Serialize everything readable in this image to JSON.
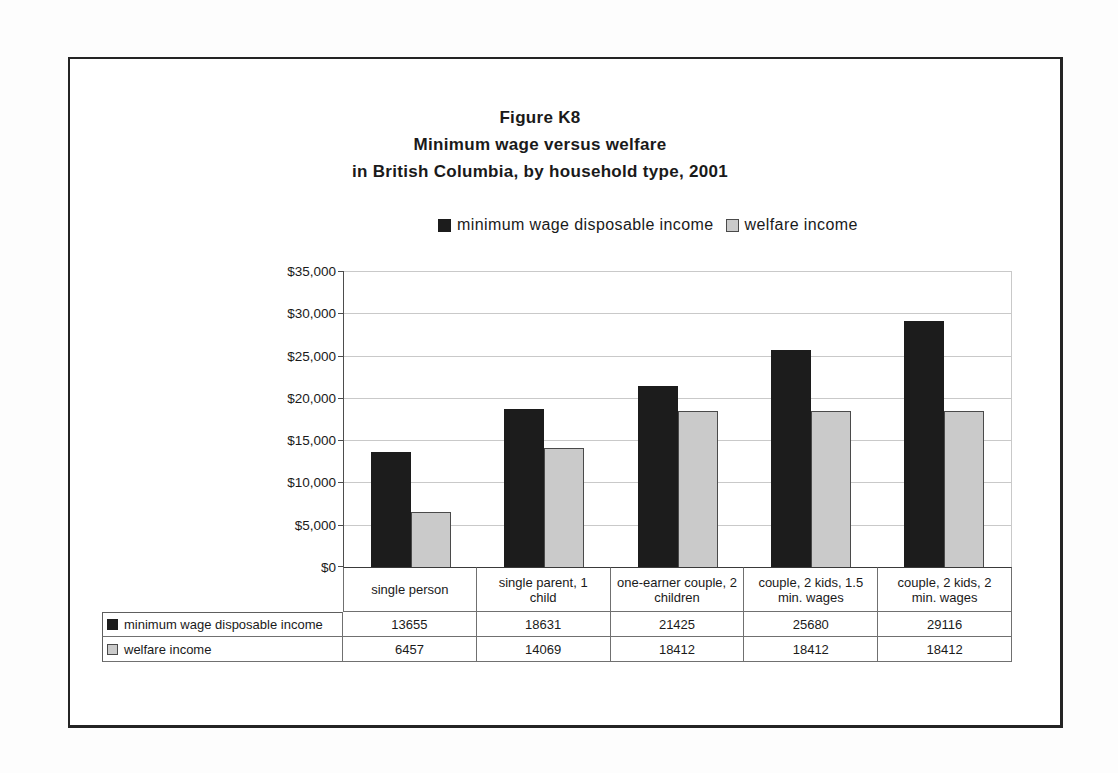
{
  "chart_data": {
    "type": "bar",
    "title": "Figure K8 Minimum wage versus welfare in British Columbia, by household type, 2001",
    "title_lines": [
      "Figure K8",
      "Minimum wage versus welfare",
      "in British Columbia, by household type, 2001"
    ],
    "categories": [
      "single person",
      "single parent, 1 child",
      "one-earner couple, 2 children",
      "couple, 2 kids, 1.5 min. wages",
      "couple, 2 kids, 2 min. wages"
    ],
    "category_lines": [
      [
        "single person"
      ],
      [
        "single parent, 1",
        "child"
      ],
      [
        "one-earner couple, 2",
        "children"
      ],
      [
        "couple, 2 kids, 1.5",
        "min. wages"
      ],
      [
        "couple, 2 kids, 2",
        "min. wages"
      ]
    ],
    "series": [
      {
        "name": "minimum wage disposable income",
        "color": "#1c1c1c",
        "values": [
          13655,
          18631,
          21425,
          25680,
          29116
        ]
      },
      {
        "name": "welfare income",
        "color": "#cacaca",
        "border": "#4a4a4a",
        "values": [
          6457,
          14069,
          18412,
          18412,
          18412
        ]
      }
    ],
    "xlabel": "",
    "ylabel": "",
    "ylim": [
      0,
      35000
    ],
    "y_tick_interval": 5000,
    "y_ticks": [
      {
        "value": 35000,
        "label": "$35,000"
      },
      {
        "value": 30000,
        "label": "$30,000"
      },
      {
        "value": 25000,
        "label": "$25,000"
      },
      {
        "value": 20000,
        "label": "$20,000"
      },
      {
        "value": 15000,
        "label": "$15,000"
      },
      {
        "value": 10000,
        "label": "$10,000"
      },
      {
        "value": 5000,
        "label": "$5,000"
      },
      {
        "value": 0,
        "label": "$0"
      }
    ],
    "grid": true,
    "legend_position": "top-center",
    "data_table_shown": true
  },
  "colors": {
    "figure_border": "#242424",
    "grid_line": "#c9c9c9",
    "axis_line": "#4d4d4d",
    "table_border": "#707070",
    "text": "#1a1a1a",
    "background": "#ffffff"
  }
}
